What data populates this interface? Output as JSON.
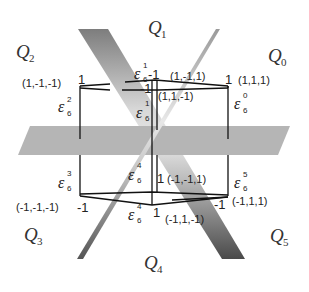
{
  "regions": [
    {
      "id": "Q0",
      "base": "Q",
      "sub": "0"
    },
    {
      "id": "Q1",
      "base": "Q",
      "sub": "1"
    },
    {
      "id": "Q2",
      "base": "Q",
      "sub": "2"
    },
    {
      "id": "Q3",
      "base": "Q",
      "sub": "3"
    },
    {
      "id": "Q4",
      "base": "Q",
      "sub": "4"
    },
    {
      "id": "Q5",
      "base": "Q",
      "sub": "5"
    }
  ],
  "vertices": [
    {
      "id": "v_top_left",
      "coord": "(1,-1,-1)",
      "value": "1",
      "eps_sup": "2",
      "eps_sub": "6"
    },
    {
      "id": "v_top_back",
      "coord": "(1,-1,1)",
      "value": "-1",
      "eps_sup": "1",
      "eps_sub": "6"
    },
    {
      "id": "v_top_right",
      "coord": "(1,1,1)",
      "value": "1",
      "eps_sup": "0",
      "eps_sub": "6"
    },
    {
      "id": "v_top_front",
      "coord": "(1,1,-1)",
      "value": "-1",
      "eps_sup": "1",
      "eps_sub": "6"
    },
    {
      "id": "v_bot_left",
      "coord": "(-1,-1,-1)",
      "value": "-1",
      "eps_sup": "3",
      "eps_sub": "6"
    },
    {
      "id": "v_bot_back",
      "coord": "(-1,-1,1)",
      "value": "1",
      "eps_sup": "4",
      "eps_sub": "6"
    },
    {
      "id": "v_bot_right",
      "coord": "(-1,1,1)",
      "value": "-1",
      "eps_sup": "5",
      "eps_sub": "6"
    },
    {
      "id": "v_bot_front",
      "coord": "(-1,1,-1)",
      "value": "1",
      "eps_sup": "4",
      "eps_sub": "6"
    }
  ],
  "symbols": {
    "epsilon": "ε"
  },
  "colors": {
    "background": "#ffffff",
    "band_dark": "#7a7a7a",
    "band_light": "#e0e0e0",
    "plane": "#b4b4b4",
    "line": "#111111"
  }
}
